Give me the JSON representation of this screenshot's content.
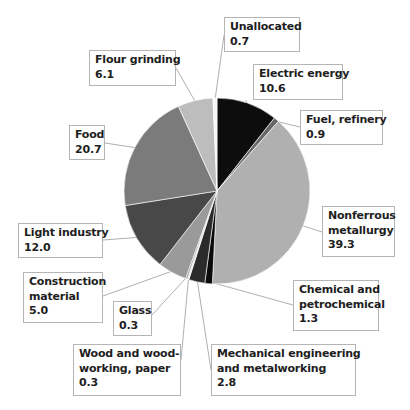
{
  "chart_data": {
    "type": "pie",
    "title": "",
    "start_angle_deg": 0,
    "direction": "clockwise",
    "center": [
      217,
      191
    ],
    "radius": 93,
    "slices": [
      {
        "name": "Electric energy",
        "lines": [
          "Electric energy"
        ],
        "value": 10.6,
        "value_label": "10.6",
        "color": "#0d0d0d",
        "box": [
          253,
          64,
          90,
          36
        ],
        "anchor": [
          246,
          100
        ]
      },
      {
        "name": "Fuel, refinery",
        "lines": [
          "Fuel, refinery"
        ],
        "value": 0.9,
        "value_label": "0.9",
        "color": "#666666",
        "box": [
          300,
          110,
          83,
          35
        ],
        "anchor": [
          300,
          127
        ]
      },
      {
        "name": "Nonferrous metallurgy",
        "lines": [
          "Nonferrous",
          "metallurgy"
        ],
        "value": 39.3,
        "value_label": "39.3",
        "color": "#b0b0b0",
        "box": [
          322,
          206,
          73,
          51
        ],
        "anchor": [
          322,
          232
        ]
      },
      {
        "name": "Chemical and petrochemical",
        "lines": [
          "Chemical and",
          "petrochemical"
        ],
        "value": 1.3,
        "value_label": "1.3",
        "color": "#0a0a0a",
        "box": [
          293,
          280,
          86,
          51
        ],
        "anchor": [
          293,
          305
        ]
      },
      {
        "name": "Mechanical engineering and metalworking",
        "lines": [
          "Mechanical engineering",
          "and metalworking"
        ],
        "value": 2.8,
        "value_label": "2.8",
        "color": "#2b2b2b",
        "box": [
          211,
          344,
          145,
          52
        ],
        "anchor": [
          211,
          370
        ]
      },
      {
        "name": "Wood and wood-working, paper",
        "lines": [
          "Wood and wood-",
          "working, paper"
        ],
        "value": 0.3,
        "value_label": "0.3",
        "color": "#e6e6e6",
        "box": [
          73,
          344,
          108,
          52
        ],
        "anchor": [
          181,
          360
        ]
      },
      {
        "name": "Glass",
        "lines": [
          "Glass"
        ],
        "value": 0.3,
        "value_label": "0.3",
        "color": "#8c8c8c",
        "box": [
          113,
          301,
          39,
          35
        ],
        "anchor": [
          152,
          315
        ]
      },
      {
        "name": "Construction material",
        "lines": [
          "Construction",
          "material"
        ],
        "value": 5.0,
        "value_label": "5.0",
        "color": "#9a9a9a",
        "box": [
          23,
          272,
          80,
          51
        ],
        "anchor": [
          103,
          296
        ]
      },
      {
        "name": "Light industry",
        "lines": [
          "Light industry"
        ],
        "value": 12.0,
        "value_label": "12.0",
        "color": "#484848",
        "box": [
          18,
          223,
          85,
          35
        ],
        "anchor": [
          103,
          240
        ]
      },
      {
        "name": "Food",
        "lines": [
          "Food"
        ],
        "value": 20.7,
        "value_label": "20.7",
        "color": "#7b7b7b",
        "box": [
          69,
          125,
          36,
          35
        ],
        "anchor": [
          105,
          143
        ]
      },
      {
        "name": "Flour grinding",
        "lines": [
          "Flour grinding"
        ],
        "value": 6.1,
        "value_label": "6.1",
        "color": "#bdbdbd",
        "box": [
          89,
          50,
          87,
          36
        ],
        "anchor": [
          176,
          68
        ]
      },
      {
        "name": "Unallocated",
        "lines": [
          "Unallocated"
        ],
        "value": 0.7,
        "value_label": "0.7",
        "color": "#f7f7f7",
        "box": [
          224,
          17,
          76,
          35
        ],
        "anchor": [
          224,
          35
        ]
      }
    ],
    "total": 100.0,
    "legend": "none",
    "grid": false
  }
}
